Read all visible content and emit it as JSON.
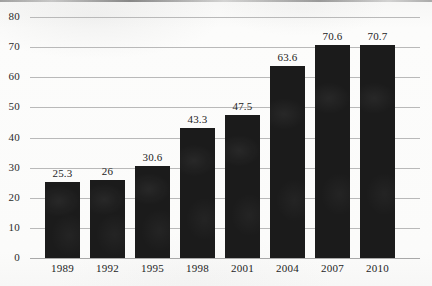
{
  "chart_data": {
    "type": "bar",
    "title": "",
    "subtitle": "",
    "xlabel": "",
    "ylabel": "",
    "categories": [
      "1989",
      "1992",
      "1995",
      "1998",
      "2001",
      "2004",
      "2007",
      "2010"
    ],
    "values": [
      25.3,
      26,
      30.6,
      43.3,
      47.5,
      63.6,
      70.6,
      70.7
    ],
    "value_labels": [
      "25.3",
      "26",
      "30.6",
      "43.3",
      "47.5",
      "63.6",
      "70.6",
      "70.7"
    ],
    "ylim": [
      0,
      80
    ],
    "ytick_labels": [
      "0",
      "10",
      "20",
      "30",
      "40",
      "50",
      "60",
      "70",
      "80"
    ],
    "ytick_values": [
      0,
      10,
      20,
      30,
      40,
      50,
      60,
      70,
      80
    ],
    "grid": true,
    "grid_axis": "y",
    "legend": false,
    "legend_position": "none",
    "annotations": [],
    "colors": {
      "bar": "#1b1b1b",
      "gridline": "#b9b9b9",
      "baseline": "#a8a8a8",
      "text": "#1d1d1d",
      "background": "#fbfbfa"
    }
  }
}
